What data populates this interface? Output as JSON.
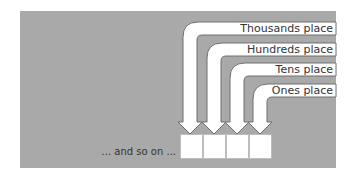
{
  "diagram": {
    "labels": [
      {
        "text": "Thousands place"
      },
      {
        "text": "Hundreds place"
      },
      {
        "text": "Tens place"
      },
      {
        "text": "Ones place"
      }
    ],
    "continuation_text": "... and so on ...",
    "box_count": 4,
    "colors": {
      "panel": "#a9a9a9",
      "arrow_fill": "#ffffff",
      "arrow_stroke": "#6f6f6f",
      "text": "#333333"
    }
  }
}
